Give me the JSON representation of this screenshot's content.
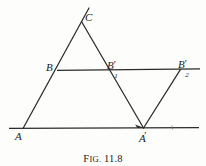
{
  "figure": {
    "caption_prefix_cap": "F",
    "caption_prefix_rest": "IG.",
    "caption_number": "11.8",
    "caption_full": "FIG. 11.8",
    "ink_color": "#2b2b2b",
    "label_color": "#1a1a1a",
    "background_color": "#fdfdfc"
  },
  "labels": {
    "C": {
      "text": "C",
      "x": 85,
      "y": 12
    },
    "B": {
      "text": "B",
      "x": 46,
      "y": 62
    },
    "B1prime": {
      "base": "B",
      "prime": "′",
      "sub": "1",
      "x": 107,
      "y": 56
    },
    "B2prime": {
      "base": "B",
      "prime": "′",
      "sub": "2",
      "x": 178,
      "y": 55
    },
    "A": {
      "text": "A",
      "x": 15,
      "y": 131
    },
    "Aprime": {
      "base": "A",
      "prime": "′",
      "x": 139,
      "y": 131
    }
  },
  "points": {
    "A": {
      "x": 23,
      "y": 128
    },
    "B": {
      "x": 58,
      "y": 70
    },
    "C": {
      "x": 82,
      "y": 22
    },
    "C_extension": {
      "x": 89,
      "y": 8
    },
    "B1prime": {
      "x": 105,
      "y": 70
    },
    "B2prime": {
      "x": 180,
      "y": 70
    },
    "Aprime": {
      "x": 143,
      "y": 128
    },
    "baseline_start": {
      "x": 9,
      "y": 128
    },
    "baseline_end": {
      "x": 199,
      "y": 128
    },
    "midline_start": {
      "x": 58,
      "y": 70
    },
    "midline_end": {
      "x": 200,
      "y": 69
    },
    "tick_mark": {
      "x": 172,
      "y": 125
    }
  },
  "segments": [
    {
      "name": "line-A-to-C-extended",
      "from": "A",
      "to": "C_extension"
    },
    {
      "name": "line-C-to-Aprime",
      "from": "C",
      "to": "Aprime"
    },
    {
      "name": "line-Aprime-to-B2prime",
      "from": "Aprime",
      "to": "B2prime"
    },
    {
      "name": "baseline-through-A-and-Aprime",
      "from": "baseline_start",
      "to": "baseline_end"
    },
    {
      "name": "midline-through-B-B1prime-B2prime",
      "from": "midline_start",
      "to": "midline_end"
    }
  ],
  "arrow": {
    "name": "arrowhead-at-Aprime",
    "x": 143,
    "y": 128,
    "direction": "right"
  }
}
